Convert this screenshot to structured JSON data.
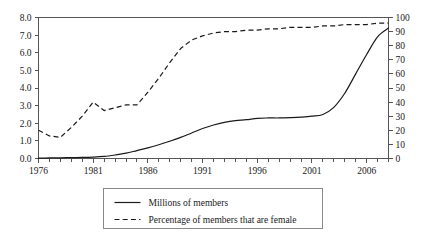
{
  "chart_data": {
    "type": "line",
    "title": "",
    "subtitle": "",
    "xlabel": "",
    "ylabel": "",
    "y2label": "",
    "xlim": [
      1976,
      2008
    ],
    "ylim": [
      0.0,
      8.0
    ],
    "y2lim": [
      0,
      100
    ],
    "grid": false,
    "legend_position": "below-center",
    "x_tick_labels": [
      "1976",
      "1981",
      "1986",
      "1991",
      "1996",
      "2001",
      "2006"
    ],
    "x_tick_values": [
      1976,
      1981,
      1986,
      1991,
      1996,
      2001,
      2006
    ],
    "x_minor_tick_interval": 1,
    "y_left_tick_labels": [
      "0.0",
      "1.0",
      "2.0",
      "3.0",
      "4.0",
      "5.0",
      "6.0",
      "7.0",
      "8.0"
    ],
    "y_left_tick_values": [
      0.0,
      1.0,
      2.0,
      3.0,
      4.0,
      5.0,
      6.0,
      7.0,
      8.0
    ],
    "y_right_tick_labels": [
      "0",
      "10",
      "20",
      "30",
      "40",
      "50",
      "60",
      "70",
      "80",
      "90",
      "100"
    ],
    "y_right_tick_values": [
      0,
      10,
      20,
      30,
      40,
      50,
      60,
      70,
      80,
      90,
      100
    ],
    "x": [
      1976,
      1977,
      1978,
      1979,
      1980,
      1981,
      1982,
      1983,
      1984,
      1985,
      1986,
      1987,
      1988,
      1989,
      1990,
      1991,
      1992,
      1993,
      1994,
      1995,
      1996,
      1997,
      1998,
      1999,
      2000,
      2001,
      2002,
      2003,
      2004,
      2005,
      2006,
      2007,
      2008
    ],
    "series": [
      {
        "name": "Millions of members",
        "axis": "left",
        "style": "solid",
        "color": "#1a1a1a",
        "unit": "millions",
        "values": [
          0.02,
          0.03,
          0.04,
          0.05,
          0.06,
          0.08,
          0.12,
          0.2,
          0.3,
          0.45,
          0.6,
          0.78,
          0.98,
          1.2,
          1.45,
          1.7,
          1.9,
          2.05,
          2.15,
          2.2,
          2.28,
          2.3,
          2.3,
          2.32,
          2.35,
          2.4,
          2.5,
          2.9,
          3.7,
          4.8,
          5.9,
          6.9,
          7.4
        ]
      },
      {
        "name": "Percentage of members that are female",
        "axis": "right",
        "style": "dashed",
        "color": "#1a1a1a",
        "unit": "percent",
        "values": [
          20,
          16,
          15,
          22,
          30,
          40,
          34,
          36,
          38,
          38,
          47,
          57,
          68,
          78,
          84,
          87,
          89,
          90,
          90,
          91,
          91,
          92,
          92,
          93,
          93,
          93,
          94,
          94,
          95,
          95,
          95,
          96,
          96
        ]
      }
    ],
    "legend_entries": [
      {
        "label": "Millions of members",
        "style": "solid"
      },
      {
        "label": "Percentage of members that are female",
        "style": "dashed"
      }
    ]
  }
}
